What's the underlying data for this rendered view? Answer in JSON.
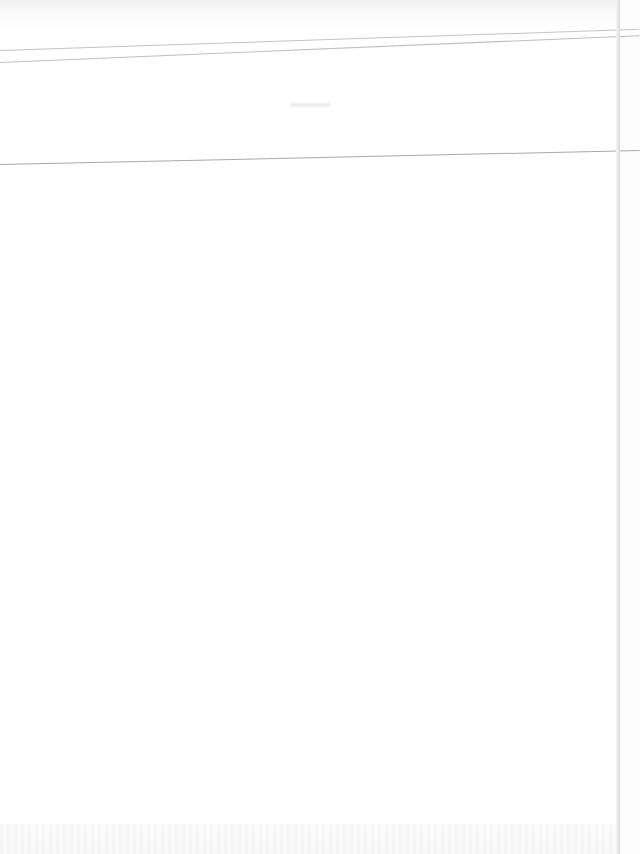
{
  "page": {
    "type": "scanned-blank-page",
    "header": {
      "faint_text": ""
    },
    "body_text": ""
  },
  "colors": {
    "paper": "#fdfdfd",
    "rule": "#b9b9b9"
  }
}
